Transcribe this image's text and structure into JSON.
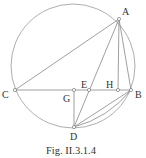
{
  "figure": {
    "caption": "Fig. II.3.1.4",
    "circle": {
      "cx": 73,
      "cy": 66,
      "r": 62
    },
    "points": {
      "A": {
        "label": "A",
        "x": 119,
        "y": 19
      },
      "B": {
        "label": "B",
        "x": 131,
        "y": 90
      },
      "C": {
        "label": "C",
        "x": 15,
        "y": 90
      },
      "D": {
        "label": "D",
        "x": 74,
        "y": 127
      },
      "E": {
        "label": "E",
        "x": 89,
        "y": 90
      },
      "G": {
        "label": "G",
        "x": 74,
        "y": 90
      },
      "H": {
        "label": "H",
        "x": 118,
        "y": 90
      }
    },
    "segments": [
      [
        "C",
        "A"
      ],
      [
        "C",
        "B"
      ],
      [
        "A",
        "B"
      ],
      [
        "A",
        "H"
      ],
      [
        "A",
        "D"
      ],
      [
        "G",
        "D"
      ],
      [
        "D",
        "B"
      ]
    ],
    "stroke_color": "#888888"
  }
}
